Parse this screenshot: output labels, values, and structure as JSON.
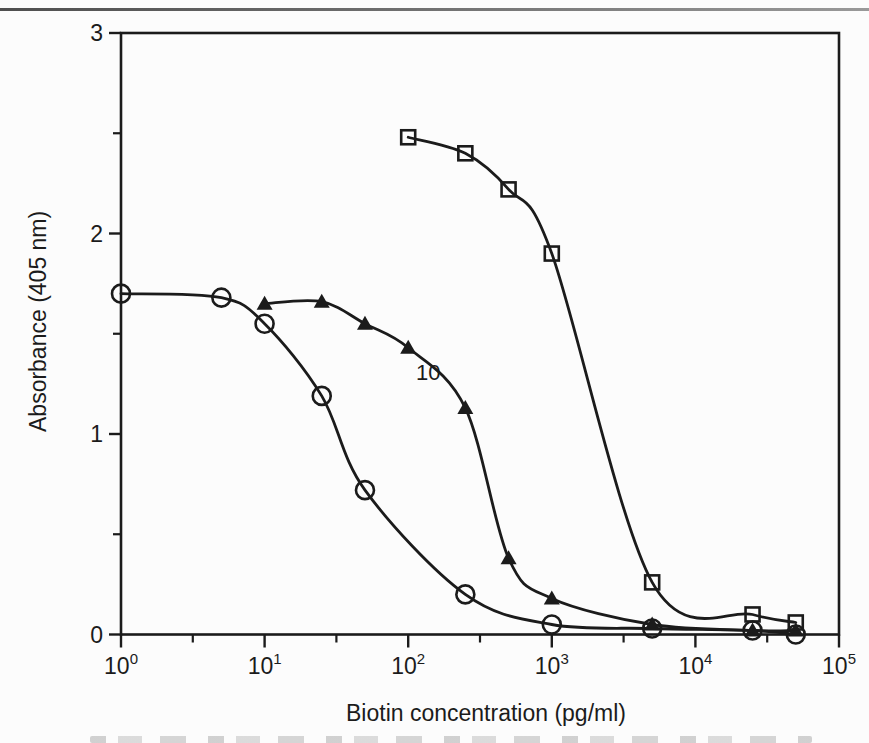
{
  "page": {
    "background": "#fcfcfc",
    "ink_color": "#1b1b1b",
    "top_rule_color": "#6e6e6e"
  },
  "chart_data": {
    "type": "line",
    "title": "",
    "xlabel": "Biotin concentration (pg/ml)",
    "ylabel": "Absorbance (405 nm)",
    "x_scale": "log",
    "xlim": [
      1,
      100000
    ],
    "ylim": [
      0,
      3
    ],
    "grid": false,
    "legend": "none",
    "frame": true,
    "x_major_ticks": [
      1,
      10,
      100,
      1000,
      10000,
      100000
    ],
    "x_tick_labels": [
      {
        "base": "10",
        "exp": "0"
      },
      {
        "base": "10",
        "exp": "1"
      },
      {
        "base": "10",
        "exp": "2"
      },
      {
        "base": "10",
        "exp": "3"
      },
      {
        "base": "10",
        "exp": "4"
      },
      {
        "base": "10",
        "exp": "5"
      }
    ],
    "x_minor_ticks": [
      3.162,
      31.62,
      316.2,
      3162,
      31620
    ],
    "y_major_ticks": [
      0,
      1,
      2,
      3
    ],
    "y_tick_labels": [
      "0",
      "1",
      "2",
      "3"
    ],
    "y_minor_ticks": [
      0.5,
      1.5,
      2.5
    ],
    "annotations": [
      {
        "text": "10",
        "x": 138,
        "y": 1.31
      }
    ],
    "series": [
      {
        "name": "open-circle-curve",
        "marker": "open-circle",
        "points": [
          [
            1,
            1.7
          ],
          [
            5,
            1.68
          ],
          [
            10,
            1.55
          ],
          [
            25,
            1.19
          ],
          [
            50,
            0.72
          ],
          [
            250,
            0.2
          ],
          [
            1000,
            0.05
          ],
          [
            5000,
            0.03
          ],
          [
            25000,
            0.02
          ],
          [
            50000,
            0.0
          ]
        ]
      },
      {
        "name": "filled-triangle-curve",
        "marker": "filled-triangle",
        "points": [
          [
            10,
            1.65
          ],
          [
            25,
            1.66
          ],
          [
            50,
            1.55
          ],
          [
            100,
            1.43
          ],
          [
            250,
            1.13
          ],
          [
            500,
            0.38
          ],
          [
            1000,
            0.18
          ],
          [
            5000,
            0.05
          ],
          [
            25000,
            0.02
          ],
          [
            50000,
            0.02
          ]
        ]
      },
      {
        "name": "open-square-curve",
        "marker": "open-square",
        "points": [
          [
            100,
            2.48
          ],
          [
            250,
            2.4
          ],
          [
            500,
            2.22
          ],
          [
            1000,
            1.9
          ],
          [
            5000,
            0.26
          ],
          [
            25000,
            0.1
          ],
          [
            50000,
            0.06
          ]
        ]
      }
    ]
  }
}
